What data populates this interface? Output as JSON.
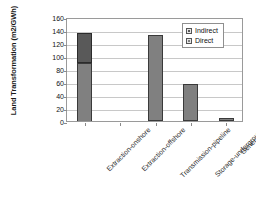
{
  "chart_data": {
    "type": "bar",
    "title": "",
    "xlabel": "",
    "ylabel": "Land Transformation (m2/GWh)",
    "ylim": [
      0,
      160
    ],
    "yticks": [
      160,
      140,
      120,
      100,
      80,
      60,
      40,
      20,
      0
    ],
    "grid": true,
    "stacked": true,
    "legend_position": "top-right-inside",
    "categories": [
      "Extraction-onshore",
      "Extraction-offshore",
      "Transmission-pipeline",
      "Storage-underground",
      "Generation"
    ],
    "series": [
      {
        "name": "Direct",
        "color": "#808080",
        "values": [
          90,
          0,
          133,
          57,
          5
        ]
      },
      {
        "name": "Indirect",
        "color": "#595959",
        "values": [
          45,
          0,
          0,
          0,
          0
        ]
      }
    ],
    "totals": [
      135,
      0,
      133,
      57,
      5
    ]
  },
  "legend": {
    "entries": [
      {
        "label": "Indirect",
        "swatch": "indirect"
      },
      {
        "label": "Direct",
        "swatch": "direct"
      }
    ]
  },
  "axis": {
    "y_title": "Land Transformation (m2/GWh)"
  }
}
